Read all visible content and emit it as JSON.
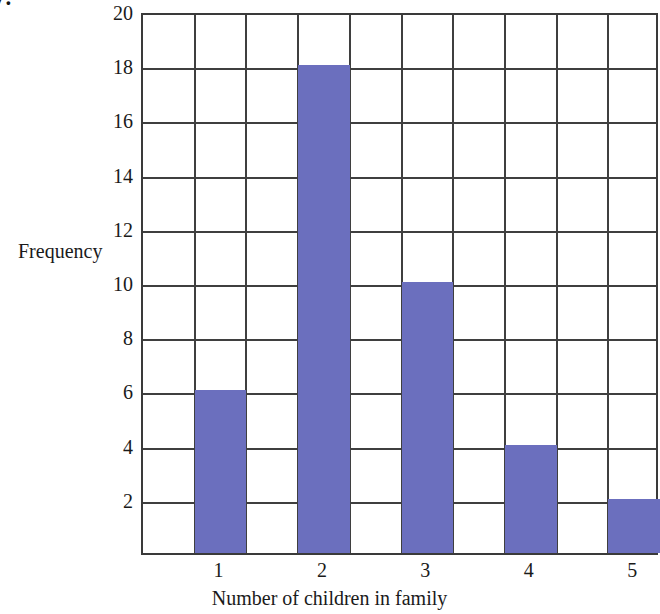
{
  "question_number": "7.",
  "chart_data": {
    "type": "bar",
    "title": "",
    "subtitle": "",
    "xlabel": "Number of children in family",
    "ylabel": "Frequency",
    "categories": [
      "1",
      "2",
      "3",
      "4",
      "5"
    ],
    "values": [
      6,
      18,
      10,
      4,
      2
    ],
    "series": [
      {
        "name": "Frequency",
        "values": [
          6,
          18,
          10,
          4,
          2
        ]
      }
    ],
    "ylim": [
      0,
      20
    ],
    "ytick_labels": [
      "20",
      "18",
      "16",
      "14",
      "12",
      "10",
      "8",
      "6",
      "4",
      "2"
    ],
    "ytick_values": [
      20,
      18,
      16,
      14,
      12,
      10,
      8,
      6,
      4,
      2
    ],
    "ytick_step": 2,
    "xtick_labels": [
      "1",
      "2",
      "3",
      "4",
      "5"
    ],
    "grid": true,
    "grid_columns": 10,
    "grid_rows": 10,
    "legend": false,
    "legend_position": "none",
    "bar_color": "#6b6fbe",
    "grid_color": "#3f3f3f",
    "frame_color": "#3a3a3a",
    "background_color": "#ffffff",
    "annotations": []
  }
}
